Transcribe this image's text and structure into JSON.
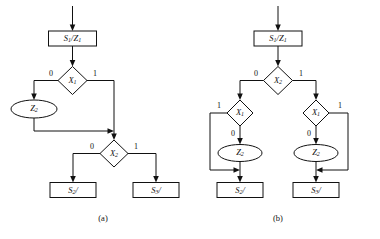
{
  "figure": {
    "kind": "asm-chart-pair",
    "background_color": "#ffffff",
    "line_color": "#111111",
    "panels": [
      {
        "id": "a",
        "caption": "(a)",
        "nodes": {
          "state_box": {
            "label_main": "S",
            "label_sub": "1",
            "label_tail": "/Z",
            "label_tail_sub": "1",
            "text": "S1/Z1"
          },
          "decision_1": {
            "label_main": "X",
            "label_sub": "1",
            "text": "X1"
          },
          "output_oval": {
            "label_main": "Z",
            "label_sub": "2",
            "text": "Z2"
          },
          "decision_2": {
            "label_main": "X",
            "label_sub": "2",
            "text": "X2"
          },
          "next_state_left": {
            "label_main": "S",
            "label_sub": "2",
            "label_tail": "/",
            "text": "S2/"
          },
          "next_state_right": {
            "label_main": "S",
            "label_sub": "3",
            "label_tail": "/",
            "text": "S3/"
          }
        },
        "edge_labels": {
          "d1_left": "0",
          "d1_right": "1",
          "d2_left": "0",
          "d2_right": "1"
        }
      },
      {
        "id": "b",
        "caption": "(b)",
        "nodes": {
          "state_box": {
            "label_main": "S",
            "label_sub": "1",
            "label_tail": "/Z",
            "label_tail_sub": "1",
            "text": "S1/Z1"
          },
          "decision_top": {
            "label_main": "X",
            "label_sub": "2",
            "text": "X2"
          },
          "decision_left": {
            "label_main": "X",
            "label_sub": "1",
            "text": "X1"
          },
          "decision_right": {
            "label_main": "X",
            "label_sub": "1",
            "text": "X1"
          },
          "output_oval_left": {
            "label_main": "Z",
            "label_sub": "2",
            "text": "Z2"
          },
          "output_oval_right": {
            "label_main": "Z",
            "label_sub": "2",
            "text": "Z2"
          },
          "next_state_left": {
            "label_main": "S",
            "label_sub": "2",
            "label_tail": "/",
            "text": "S2/"
          },
          "next_state_right": {
            "label_main": "S",
            "label_sub": "3",
            "label_tail": "/",
            "text": "S3/"
          }
        },
        "edge_labels": {
          "top_left": "0",
          "top_right": "1",
          "left_bypass": "1",
          "left_down": "0",
          "right_bypass": "1",
          "right_down": "0"
        }
      }
    ]
  }
}
